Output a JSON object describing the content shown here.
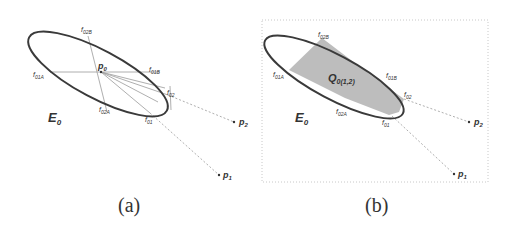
{
  "panels": [
    {
      "caption": "(a)",
      "ellipse_label": "E",
      "ellipse_sub": "0",
      "points": {
        "p0": {
          "main": "p",
          "sub": "0"
        },
        "p1": {
          "main": "p",
          "sub": "1"
        },
        "p2": {
          "main": "p",
          "sub": "2"
        }
      },
      "tangent_labels": {
        "f02B": {
          "main": "f",
          "sub": "02B"
        },
        "f01B": {
          "main": "f",
          "sub": "01B"
        },
        "f01A": {
          "main": "f",
          "sub": "01A"
        },
        "f02A": {
          "main": "f",
          "sub": "02A"
        },
        "f02": {
          "main": "f",
          "sub": "02"
        },
        "f01": {
          "main": "f",
          "sub": "01"
        }
      }
    },
    {
      "caption": "(b)",
      "ellipse_label": "E",
      "ellipse_sub": "0",
      "region_label": {
        "main": "Q",
        "sub": "0(1,2)"
      },
      "points": {
        "p1": {
          "main": "p",
          "sub": "1"
        },
        "p2": {
          "main": "p",
          "sub": "2"
        }
      },
      "tangent_labels": {
        "f02B": {
          "main": "f",
          "sub": "02B"
        },
        "f01B": {
          "main": "f",
          "sub": "01B"
        },
        "f01A": {
          "main": "f",
          "sub": "01A"
        },
        "f02A": {
          "main": "f",
          "sub": "02A"
        },
        "f02": {
          "main": "f",
          "sub": "02"
        },
        "f01": {
          "main": "f",
          "sub": "01"
        }
      }
    }
  ],
  "colors": {
    "ellipse": "#3a3a3a",
    "lines": "#9a9a9a",
    "region": "#bdbdbd",
    "frame": "#c8c8c8"
  }
}
